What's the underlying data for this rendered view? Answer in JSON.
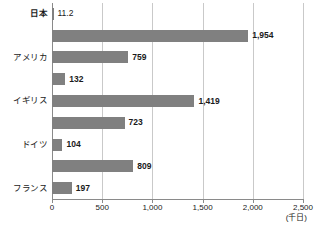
{
  "chart_data": {
    "type": "bar",
    "orientation": "horizontal",
    "title": "",
    "xlabel": "",
    "ylabel": "",
    "unit_label": "(千日)",
    "xlim": [
      0,
      2500
    ],
    "grid": true,
    "legend": false,
    "bar_color": "#808080",
    "gridline_color": "#c9c9c9",
    "axis_color": "#8a8a8a",
    "categories": [
      "日本",
      "アメリカ",
      "イギリス",
      "ドイツ",
      "フランス",
      "イタリア",
      "スウェーデン",
      "韓国",
      "オーストラリア"
    ],
    "values": [
      11.2,
      1954,
      759,
      132,
      1419,
      723,
      104,
      809,
      197
    ],
    "value_labels": [
      "11.2",
      "1,954",
      "759",
      "132",
      "1,419",
      "723",
      "104",
      "809",
      "197"
    ],
    "emphasized_category": "日本",
    "xticks": [
      0,
      500,
      1000,
      1500,
      2000,
      2500
    ],
    "xtick_labels": [
      "0",
      "500",
      "1,000",
      "1,500",
      "2,000",
      "2,500"
    ]
  }
}
